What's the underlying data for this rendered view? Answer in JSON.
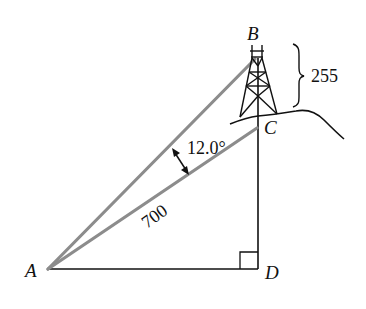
{
  "diagram": {
    "points": {
      "A": {
        "label": "A"
      },
      "B": {
        "label": "B"
      },
      "C": {
        "label": "C"
      },
      "D": {
        "label": "D"
      }
    },
    "measurements": {
      "tower_height": "255",
      "distance_AC": "700",
      "angle_BAC": "12.0°"
    },
    "colors": {
      "sight_lines": "#8c8c8c",
      "ink": "#111111"
    }
  }
}
